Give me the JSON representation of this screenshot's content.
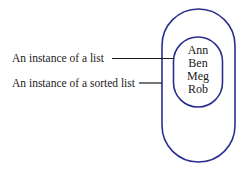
{
  "diagram": {
    "labels": [
      {
        "text": "An instance of a list"
      },
      {
        "text": "An instance of a sorted list"
      }
    ],
    "inner_list": {
      "items": [
        "Ann",
        "Ben",
        "Meg",
        "Rob"
      ]
    },
    "colors": {
      "outline": "#2a2f8f",
      "leader_line": "#1a1a1a",
      "text": "#1a1a1a"
    }
  }
}
